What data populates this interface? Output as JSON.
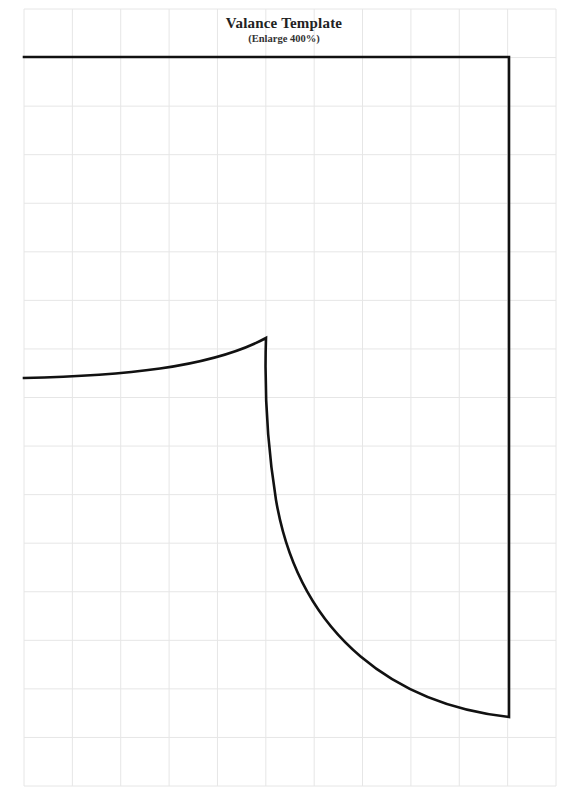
{
  "document": {
    "title": "Valance Template",
    "subtitle": "(Enlarge 400%)"
  },
  "grid": {
    "left": 24,
    "top": 9,
    "right": 556,
    "bottom": 786,
    "columns": 11,
    "rows": 16,
    "line_color": "#e6e6e6"
  },
  "pattern": {
    "stroke_color": "#111111",
    "stroke_width": 2.6,
    "path": "M 24 57 L 509 57 L 509 717 C 400 705, 300 640, 276 500 C 268 450, 264 400, 266 338 C 210 368, 120 376, 24 378"
  }
}
